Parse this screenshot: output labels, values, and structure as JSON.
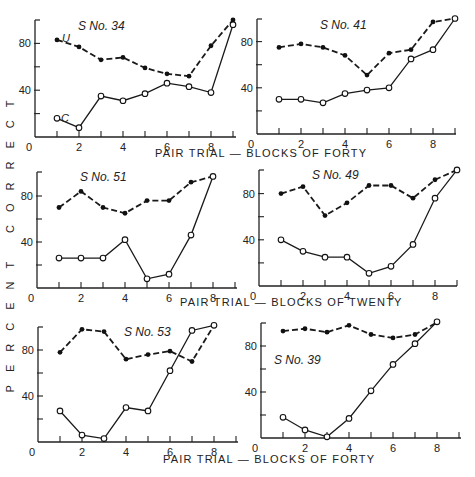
{
  "figure": {
    "ylabel": "PERCENT CORRECT",
    "xlabel_forty": "PAIR TRIAL — BLOCKS OF FORTY",
    "xlabel_twenty": "PAIR TRIAL — BLOCKS OF TWENTY"
  },
  "chart_data": [
    {
      "type": "line",
      "title": "S No. 34",
      "xlabel": "PAIR TRIAL — BLOCKS OF FORTY",
      "ylabel": "PERCENT CORRECT",
      "x": [
        1,
        2,
        3,
        4,
        5,
        6,
        7,
        8,
        9
      ],
      "xticks": [
        0,
        2,
        4,
        6,
        8
      ],
      "yticks": [
        40,
        80
      ],
      "ylim": [
        0,
        100
      ],
      "series": [
        {
          "name": "U",
          "style": "dashed, filled markers",
          "values": [
            83,
            77,
            66,
            68,
            59,
            54,
            52,
            78,
            100
          ]
        },
        {
          "name": "C",
          "style": "solid, open markers",
          "values": [
            16,
            8,
            35,
            31,
            37,
            46,
            43,
            38,
            96
          ]
        }
      ]
    },
    {
      "type": "line",
      "title": "S No. 41",
      "xlabel": "PAIR TRIAL — BLOCKS OF FORTY",
      "ylabel": "PERCENT CORRECT",
      "x": [
        1,
        2,
        3,
        4,
        5,
        6,
        7,
        8,
        9
      ],
      "xticks": [
        0,
        2,
        4,
        6,
        8
      ],
      "yticks": [
        40,
        80
      ],
      "ylim": [
        0,
        100
      ],
      "series": [
        {
          "name": "U",
          "style": "dashed, filled markers",
          "values": [
            75,
            78,
            75,
            68,
            51,
            70,
            73,
            97,
            100
          ]
        },
        {
          "name": "C",
          "style": "solid, open markers",
          "values": [
            30,
            30,
            27,
            35,
            38,
            40,
            65,
            73,
            100
          ]
        }
      ]
    },
    {
      "type": "line",
      "title": "S No. 51",
      "xlabel": "PAIR TRIAL — BLOCKS OF TWENTY",
      "ylabel": "PERCENT CORRECT",
      "x": [
        1,
        2,
        3,
        4,
        5,
        6,
        7,
        8
      ],
      "xticks": [
        0,
        2,
        4,
        6,
        8
      ],
      "yticks": [
        40,
        80
      ],
      "ylim": [
        0,
        100
      ],
      "series": [
        {
          "name": "U",
          "style": "dashed, filled markers",
          "values": [
            70,
            84,
            70,
            65,
            76,
            76,
            92,
            97
          ]
        },
        {
          "name": "C",
          "style": "solid, open markers",
          "values": [
            26,
            26,
            26,
            42,
            8,
            12,
            46,
            97
          ]
        }
      ]
    },
    {
      "type": "line",
      "title": "S No. 49",
      "xlabel": "PAIR TRIAL — BLOCKS OF TWENTY",
      "ylabel": "PERCENT CORRECT",
      "x": [
        1,
        2,
        3,
        4,
        5,
        6,
        7,
        8,
        9
      ],
      "xticks": [
        0,
        2,
        4,
        6,
        8
      ],
      "yticks": [
        40,
        80
      ],
      "ylim": [
        0,
        100
      ],
      "series": [
        {
          "name": "U",
          "style": "dashed, filled markers",
          "values": [
            80,
            86,
            61,
            72,
            87,
            87,
            76,
            92,
            101
          ]
        },
        {
          "name": "C",
          "style": "solid, open markers",
          "values": [
            40,
            30,
            25,
            25,
            11,
            17,
            36,
            76,
            101
          ]
        }
      ]
    },
    {
      "type": "line",
      "title": "S No. 53",
      "xlabel": "PAIR TRIAL — BLOCKS OF FORTY",
      "ylabel": "PERCENT CORRECT",
      "x": [
        1,
        2,
        3,
        4,
        5,
        6,
        7,
        8
      ],
      "xticks": [
        0,
        2,
        4,
        6,
        8
      ],
      "yticks": [
        40,
        80
      ],
      "ylim": [
        0,
        100
      ],
      "series": [
        {
          "name": "U",
          "style": "dashed, filled markers",
          "values": [
            78,
            98,
            96,
            72,
            76,
            79,
            70,
            103
          ]
        },
        {
          "name": "C",
          "style": "solid, open markers",
          "values": [
            27,
            6,
            3,
            30,
            27,
            62,
            97,
            103
          ]
        }
      ]
    },
    {
      "type": "line",
      "title": "S No. 39",
      "xlabel": "PAIR TRIAL — BLOCKS OF FORTY",
      "ylabel": "PERCENT CORRECT",
      "x": [
        1,
        2,
        3,
        4,
        5,
        6,
        7,
        8
      ],
      "xticks": [
        0,
        2,
        4,
        6,
        8
      ],
      "yticks": [
        40,
        80
      ],
      "ylim": [
        0,
        100
      ],
      "series": [
        {
          "name": "U",
          "style": "dashed, filled markers",
          "values": [
            93,
            95,
            92,
            98,
            90,
            87,
            90,
            101
          ]
        },
        {
          "name": "C",
          "style": "solid, open markers",
          "values": [
            18,
            7,
            1,
            17,
            41,
            64,
            82,
            102
          ]
        }
      ]
    }
  ],
  "layout": {
    "panels": [
      {
        "x0": 35,
        "y0": 137,
        "dx": 22,
        "py": 1.17,
        "top": 20,
        "right": 236,
        "title_x": 78,
        "title_y": 30,
        "tags": {
          "U": [
            62,
            42
          ],
          "C": [
            61,
            122
          ]
        }
      },
      {
        "x0": 257,
        "y0": 134,
        "dx": 22,
        "py": 1.155,
        "top": 19,
        "right": 456,
        "title_x": 320,
        "title_y": 29
      },
      {
        "x0": 37,
        "y0": 288,
        "dx": 22,
        "py": 1.15,
        "top": 172,
        "right": 237,
        "title_x": 80,
        "title_y": 181
      },
      {
        "x0": 259,
        "y0": 286,
        "dx": 22,
        "py": 1.155,
        "top": 170,
        "right": 457,
        "title_x": 312,
        "title_y": 179
      },
      {
        "x0": 38,
        "y0": 442,
        "dx": 22,
        "py": 1.15,
        "top": 327,
        "right": 238,
        "title_x": 124,
        "title_y": 336
      },
      {
        "x0": 261,
        "y0": 438,
        "dx": 22,
        "py": 1.15,
        "top": 323,
        "right": 461,
        "title_x": 274,
        "title_y": 364
      }
    ],
    "xlabels": [
      {
        "text_key": "xlabel_forty",
        "x": 155,
        "y": 157
      },
      {
        "text_key": "xlabel_twenty",
        "x": 180,
        "y": 306
      },
      {
        "text_key": "xlabel_forty",
        "x": 163,
        "y": 463
      }
    ],
    "ylabel_x": 14,
    "ylabel_y_center": 240
  }
}
